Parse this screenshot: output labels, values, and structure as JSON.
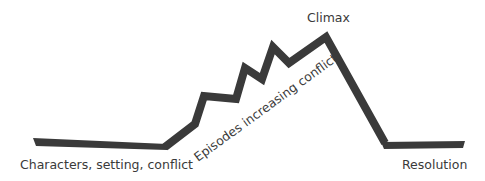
{
  "diagram": {
    "type": "plot-structure",
    "line_color": "#3a3a3a",
    "labels": {
      "exposition": "Characters, setting, conflict",
      "rising_action": "Episodes increasing conflict",
      "climax": "Climax",
      "resolution": "Resolution"
    },
    "path_points": [
      [
        33,
        140
      ],
      [
        167,
        148
      ],
      [
        196,
        124
      ],
      [
        205,
        95
      ],
      [
        237,
        99
      ],
      [
        245,
        67
      ],
      [
        262,
        78
      ],
      [
        273,
        45
      ],
      [
        290,
        62
      ],
      [
        327,
        34
      ],
      [
        385,
        146
      ],
      [
        465,
        145
      ]
    ]
  }
}
